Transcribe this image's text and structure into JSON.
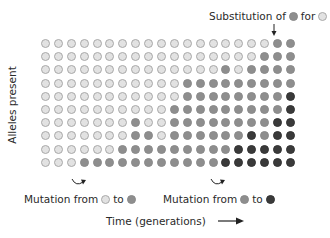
{
  "diagram": {
    "y_axis_label": "Alleles present",
    "x_axis_label": "Time (generations)",
    "annotations": {
      "substitution": {
        "text_before": "Substitution of",
        "symbol1": "M",
        "text_mid": "for",
        "symbol2": "L"
      },
      "mutation1": {
        "text_before": "Mutation from",
        "from": "L",
        "text_mid": "to",
        "to": "M"
      },
      "mutation2": {
        "text_before": "Mutation from",
        "from": "M",
        "text_mid": "to",
        "to": "D"
      }
    },
    "legend": {
      "L": "light allele",
      "M": "medium allele",
      "D": "dark allele"
    },
    "colors": {
      "light": "#e2e2e2",
      "medium": "#8e8e8e",
      "dark": "#3a3a3a"
    },
    "grid": {
      "rows": 10,
      "columns": 20,
      "cells": [
        "LLLLLLLLLLLLLLLLLLMM",
        "LLLLLLLLLLLLLLLLLMMM",
        "LLLLLLLLLLLLLLMLMMMM",
        "LLLLLLLLLLLMMMMMMMMM",
        "LLLLLLLLLLLMMMMMMMMD",
        "LLLLLLLLLLMMMMMMMMMD",
        "LLLLLLLMLLMMMMMMMMDD",
        "LLLLLLLMMLMMMMMMDMDD",
        "LLLLLLMMMMMMMMMDDDDD",
        "LLLMMMMMMMMMMMDDDDDD"
      ]
    }
  }
}
